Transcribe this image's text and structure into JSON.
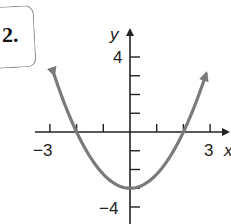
{
  "problem": {
    "number": "2."
  },
  "chart_data": {
    "type": "line",
    "title": "",
    "xlabel": "x",
    "ylabel": "y",
    "function": "y = (3/4)x^2 - 3",
    "x": [
      -2.8,
      -2.5,
      -2,
      -1.5,
      -1,
      -0.5,
      0,
      0.5,
      1,
      1.5,
      2,
      2.5,
      2.8
    ],
    "values": [
      2.88,
      1.69,
      0,
      -1.31,
      -2.25,
      -2.81,
      -3,
      -2.81,
      -2.25,
      -1.31,
      0,
      1.69,
      2.88
    ],
    "x_ticks": [
      -3,
      -2,
      -1,
      0,
      1,
      2,
      3
    ],
    "y_ticks": [
      -4,
      -3,
      -2,
      -1,
      0,
      1,
      2,
      3,
      4
    ],
    "x_tick_labels": [
      "-3",
      "3"
    ],
    "y_tick_labels": [
      "4",
      "-4"
    ],
    "xlim": [
      -3.2,
      3.5
    ],
    "ylim": [
      -4.5,
      5.5
    ],
    "grid": false,
    "legend": null,
    "annotations": [
      "curve ends with arrows at both tops"
    ],
    "colors": {
      "curve": "#7a7a7a",
      "axes": "#222222"
    }
  },
  "labels": {
    "x_axis": "x",
    "y_axis": "y",
    "x_min_label": "−3",
    "x_max_label": "3",
    "y_max_label": "4",
    "y_min_label": "−4"
  }
}
